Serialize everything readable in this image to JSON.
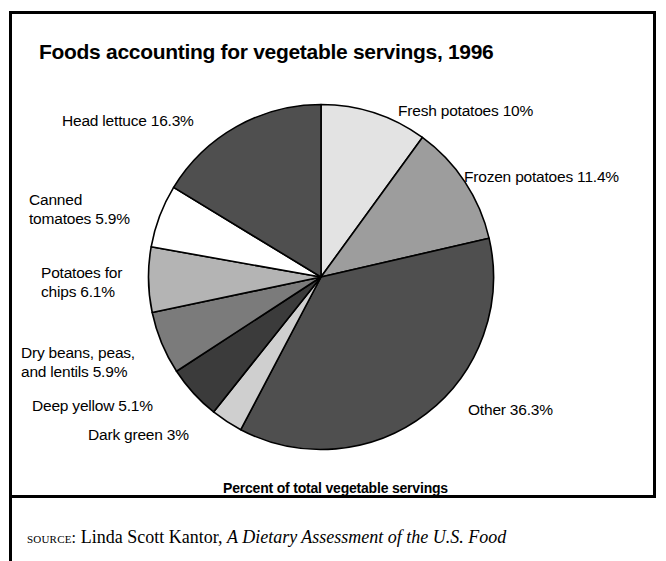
{
  "figure": {
    "title": "Foods accounting for vegetable servings, 1996",
    "axis_caption": "Percent of total vegetable servings",
    "source": {
      "kicker": "source:",
      "author": " Linda Scott Kantor, ",
      "work_title": "A Dietary Assessment of the U.S. Food"
    }
  },
  "chart_data": {
    "type": "pie",
    "title": "Foods accounting for vegetable servings, 1996",
    "subtitle": "Percent of total vegetable servings",
    "units": "percent",
    "start_angle_deg": 0,
    "direction": "clockwise",
    "legend": "none (labels placed outside slices)",
    "total": 100.0,
    "categories": [
      "Fresh potatoes",
      "Frozen potatoes",
      "Other",
      "Dark green",
      "Deep yellow",
      "Dry beans, peas, and lentils",
      "Potatoes for chips",
      "Canned tomatoes",
      "Head lettuce"
    ],
    "values": [
      10.0,
      11.4,
      36.3,
      3.0,
      5.1,
      5.9,
      6.1,
      5.9,
      16.3
    ],
    "slices": [
      {
        "name": "Fresh potatoes",
        "value": 10.0,
        "label": "Fresh potatoes 10%",
        "color": "#e3e3e3"
      },
      {
        "name": "Frozen potatoes",
        "value": 11.4,
        "label": "Frozen potatoes 11.4%",
        "color": "#9d9d9d"
      },
      {
        "name": "Other",
        "value": 36.3,
        "label": "Other 36.3%",
        "color": "#4f4f4f"
      },
      {
        "name": "Dark green",
        "value": 3.0,
        "label": "Dark green 3%",
        "color": "#cfcfcf"
      },
      {
        "name": "Deep yellow",
        "value": 5.1,
        "label": "Deep yellow 5.1%",
        "color": "#3b3b3b"
      },
      {
        "name": "Dry beans, peas, and lentils",
        "value": 5.9,
        "label": "Dry beans, peas,\nand lentils 5.9%",
        "color": "#7b7b7b"
      },
      {
        "name": "Potatoes for chips",
        "value": 6.1,
        "label": "Potatoes for\nchips 6.1%",
        "color": "#b4b4b4"
      },
      {
        "name": "Canned tomatoes",
        "value": 5.9,
        "label": "Canned\ntomatoes 5.9%",
        "color": "#ffffff"
      },
      {
        "name": "Head lettuce",
        "value": 16.3,
        "label": "Head lettuce 16.3%",
        "color": "#4f4f4f"
      }
    ]
  }
}
